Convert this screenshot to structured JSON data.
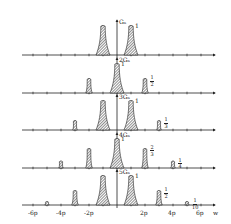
{
  "chart_data": {
    "type": "bar",
    "title": "",
    "xlabel": "w",
    "x_ticks": [
      "-6p",
      "-4p",
      "-2p",
      "2p",
      "4p",
      "6p"
    ],
    "panels": [
      {
        "ylabel": "G_N",
        "ylabel_prefix": "",
        "peaks": [
          {
            "x": -1,
            "h": 1
          },
          {
            "x": 1,
            "h": 1
          }
        ],
        "labels": [
          {
            "x": 1,
            "text": "1"
          }
        ]
      },
      {
        "ylabel": "G_N",
        "ylabel_prefix": "2",
        "peaks": [
          {
            "x": -2,
            "h": 0.5
          },
          {
            "x": 0,
            "h": 1
          },
          {
            "x": 2,
            "h": 0.5
          }
        ],
        "labels": [
          {
            "x": 0,
            "text": "1"
          },
          {
            "x": 2,
            "num": "1",
            "den": "2"
          }
        ]
      },
      {
        "ylabel": "G_N",
        "ylabel_prefix": "3",
        "peaks": [
          {
            "x": -3,
            "h": 0.333
          },
          {
            "x": -1,
            "h": 1
          },
          {
            "x": 1,
            "h": 1
          },
          {
            "x": 3,
            "h": 0.333
          }
        ],
        "labels": [
          {
            "x": 1,
            "text": "1"
          },
          {
            "x": 3,
            "num": "1",
            "den": "3"
          }
        ]
      },
      {
        "ylabel": "G_N",
        "ylabel_prefix": "4",
        "peaks": [
          {
            "x": -4,
            "h": 0.25
          },
          {
            "x": -2,
            "h": 0.667
          },
          {
            "x": 0,
            "h": 1
          },
          {
            "x": 2,
            "h": 0.667
          },
          {
            "x": 4,
            "h": 0.25
          }
        ],
        "labels": [
          {
            "x": 0,
            "text": "1"
          },
          {
            "x": 2,
            "num": "2",
            "den": "3"
          },
          {
            "x": 4,
            "num": "1",
            "den": "4"
          }
        ]
      },
      {
        "ylabel": "G_N",
        "ylabel_prefix": "5",
        "peaks": [
          {
            "x": -5,
            "h": 0.1
          },
          {
            "x": -3,
            "h": 0.5
          },
          {
            "x": -1,
            "h": 1
          },
          {
            "x": 1,
            "h": 1
          },
          {
            "x": 3,
            "h": 0.5
          },
          {
            "x": 5,
            "h": 0.1
          }
        ],
        "labels": [
          {
            "x": 1,
            "text": "1"
          },
          {
            "x": 3,
            "num": "1",
            "den": "2"
          },
          {
            "x": 5,
            "num": "1",
            "den": "10"
          }
        ]
      }
    ],
    "grid": false,
    "legend": null
  },
  "layout": {
    "origin_x": 117,
    "unit_px": 14,
    "baselines": [
      55,
      93,
      130,
      168,
      205
    ],
    "peak_height_px": 30,
    "axis_left": 22,
    "axis_right": 215
  },
  "colors": {
    "ink": "#222222",
    "hatch": "#555555",
    "background": "#ffffff"
  }
}
